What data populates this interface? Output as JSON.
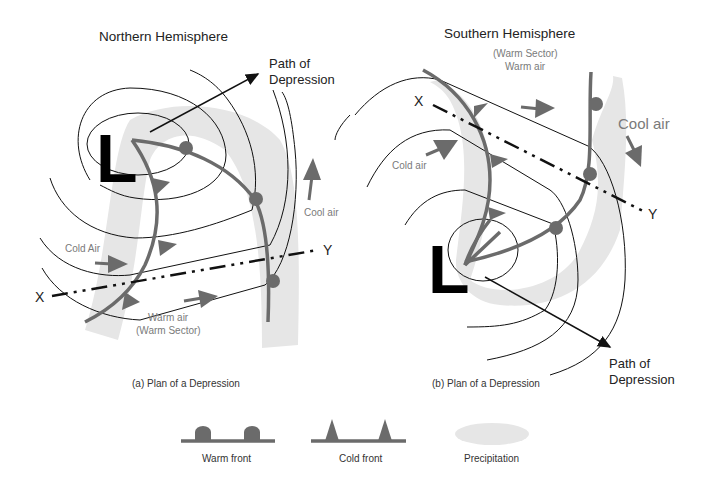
{
  "panel_a": {
    "title": "Northern Hemisphere",
    "path_label_1": "Path of",
    "path_label_2": "Depression",
    "low_letter": "L",
    "cool_air": "Cool air",
    "cold_air": "Cold Air",
    "warm_air_1": "Warm air",
    "warm_air_2": "(Warm Sector)",
    "x_label": "X",
    "y_label": "Y",
    "caption": "(a) Plan of a Depression"
  },
  "panel_b": {
    "title": "Southern Hemisphere",
    "warm_sector_1": "(Warm Sector)",
    "warm_sector_2": "Warm air",
    "cool_air": "Cool air",
    "cold_air": "Cold air",
    "low_letter": "L",
    "x_label": "X",
    "y_label": "Y",
    "path_label_1": "Path of",
    "path_label_2": "Depression",
    "caption": "(b) Plan of a Depression"
  },
  "legend": {
    "warm_front": "Warm front",
    "cold_front": "Cold front",
    "precipitation": "Precipitation"
  },
  "colors": {
    "front": "#6b6b6b",
    "precipitation": "#e6e6e6",
    "isobar": "#111111",
    "label_grey": "#7a7a7a"
  }
}
